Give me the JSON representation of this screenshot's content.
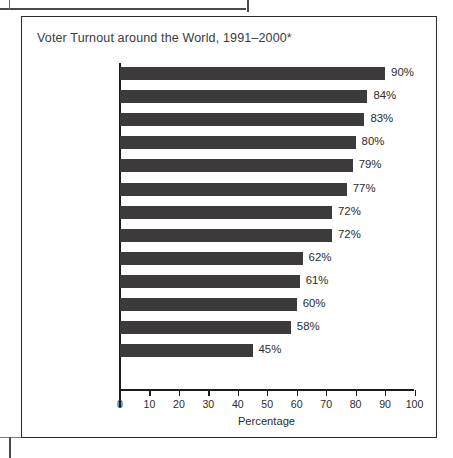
{
  "figure": {
    "title": "Voter Turnout around the World, 1991–2000*"
  },
  "chart_data": {
    "type": "bar",
    "orientation": "horizontal",
    "title": "Voter Turnout around the World, 1991–2000*",
    "xlabel": "Percentage",
    "ylabel": "",
    "xlim": [
      0,
      100
    ],
    "xticks": [
      "0",
      "10",
      "20",
      "30",
      "40",
      "50",
      "60",
      "70",
      "80",
      "90",
      "100"
    ],
    "grid": false,
    "legend": null,
    "bar_color": "#3c3a3b",
    "axis_color": "#1c1c1c",
    "categories": [
      "Italy",
      "Sweden",
      "Australia",
      "Turkey",
      "Spain",
      "Brazil",
      "Germany",
      "United Kingdom",
      "Thailand",
      "France",
      "Canada",
      "Mexico",
      "United States"
    ],
    "values": [
      90,
      84,
      83,
      80,
      79,
      77,
      72,
      72,
      62,
      61,
      60,
      58,
      45
    ],
    "value_labels": [
      "90%",
      "84%",
      "83%",
      "80%",
      "79%",
      "77%",
      "72%",
      "72%",
      "62%",
      "61%",
      "60%",
      "58%",
      "45%"
    ]
  }
}
